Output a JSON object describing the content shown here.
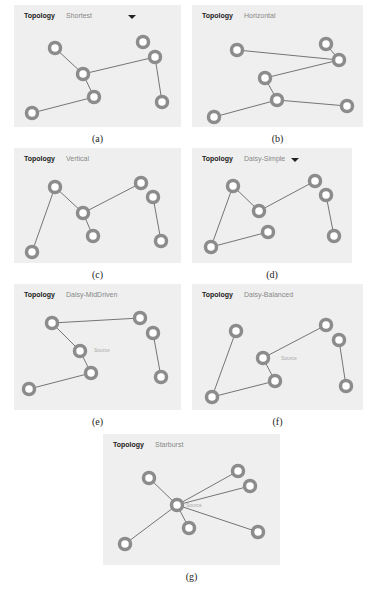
{
  "panels": [
    {
      "id": "a",
      "label": "Topology",
      "mode": "Shortest",
      "dropdown": true,
      "caption": "(a)",
      "box": [
        14,
        5,
        167,
        122
      ],
      "nodes": [
        [
          55,
          48
        ],
        [
          83,
          74
        ],
        [
          94,
          97
        ],
        [
          32,
          113
        ],
        [
          143,
          42
        ],
        [
          155,
          57
        ],
        [
          162,
          102
        ]
      ],
      "edges": [
        [
          0,
          1
        ],
        [
          1,
          2
        ],
        [
          2,
          3
        ],
        [
          1,
          5
        ],
        [
          5,
          6
        ]
      ],
      "source": null
    },
    {
      "id": "b",
      "label": "Topology",
      "mode": "Horizontal",
      "dropdown": false,
      "caption": "(b)",
      "box": [
        192,
        5,
        171,
        122
      ],
      "nodes": [
        [
          237,
          50
        ],
        [
          326,
          44
        ],
        [
          339,
          60
        ],
        [
          265,
          78
        ],
        [
          277,
          100
        ],
        [
          347,
          106
        ],
        [
          214,
          117
        ]
      ],
      "edges": [
        [
          0,
          2
        ],
        [
          1,
          2
        ],
        [
          2,
          3
        ],
        [
          3,
          4
        ],
        [
          4,
          6
        ],
        [
          4,
          5
        ]
      ],
      "source": null
    },
    {
      "id": "c",
      "label": "Topology",
      "mode": "Vertical",
      "dropdown": false,
      "caption": "(c)",
      "box": [
        14,
        148,
        167,
        115
      ],
      "nodes": [
        [
          55,
          187
        ],
        [
          83,
          213
        ],
        [
          93,
          236
        ],
        [
          32,
          252
        ],
        [
          141,
          183
        ],
        [
          153,
          197
        ],
        [
          161,
          241
        ]
      ],
      "edges": [
        [
          3,
          0
        ],
        [
          0,
          1
        ],
        [
          1,
          4
        ],
        [
          1,
          2
        ],
        [
          5,
          6
        ]
      ],
      "source": null
    },
    {
      "id": "d",
      "label": "Topology",
      "mode": "Daisy-Simple",
      "dropdown": true,
      "caption": "(d)",
      "box": [
        192,
        148,
        160,
        115
      ],
      "nodes": [
        [
          233,
          186
        ],
        [
          259,
          211
        ],
        [
          268,
          232
        ],
        [
          211,
          247
        ],
        [
          315,
          181
        ],
        [
          326,
          195
        ],
        [
          334,
          236
        ]
      ],
      "edges": [
        [
          3,
          0
        ],
        [
          0,
          1
        ],
        [
          1,
          4
        ],
        [
          3,
          2
        ],
        [
          5,
          6
        ]
      ],
      "source": null
    },
    {
      "id": "e",
      "label": "Topology",
      "mode": "Daisy-MidDriven",
      "dropdown": false,
      "caption": "(e)",
      "box": [
        14,
        284,
        167,
        126
      ],
      "nodes": [
        [
          52,
          323
        ],
        [
          80,
          351
        ],
        [
          91,
          373
        ],
        [
          29,
          389
        ],
        [
          140,
          318
        ],
        [
          153,
          333
        ],
        [
          161,
          377
        ]
      ],
      "edges": [
        [
          0,
          4
        ],
        [
          0,
          1
        ],
        [
          1,
          2
        ],
        [
          2,
          3
        ],
        [
          5,
          6
        ]
      ],
      "source": {
        "text": "Source",
        "x": 94,
        "y": 352
      }
    },
    {
      "id": "f",
      "label": "Topology",
      "mode": "Daisy-Balanced",
      "dropdown": false,
      "caption": "(f)",
      "box": [
        192,
        284,
        171,
        126
      ],
      "nodes": [
        [
          236,
          331
        ],
        [
          263,
          358
        ],
        [
          275,
          381
        ],
        [
          212,
          397
        ],
        [
          326,
          325
        ],
        [
          339,
          340
        ],
        [
          346,
          386
        ]
      ],
      "edges": [
        [
          0,
          3
        ],
        [
          3,
          2
        ],
        [
          2,
          1
        ],
        [
          1,
          4
        ],
        [
          5,
          6
        ]
      ],
      "source": {
        "text": "Source",
        "x": 281,
        "y": 360
      }
    },
    {
      "id": "g",
      "label": "Topology",
      "mode": "Starburst",
      "dropdown": false,
      "caption": "(g)",
      "box": [
        103,
        434,
        177,
        131
      ],
      "nodes": [
        [
          149,
          478
        ],
        [
          177,
          505
        ],
        [
          189,
          528
        ],
        [
          125,
          544
        ],
        [
          238,
          471
        ],
        [
          250,
          486
        ],
        [
          258,
          532
        ]
      ],
      "edges": [
        [
          1,
          0
        ],
        [
          1,
          2
        ],
        [
          1,
          3
        ],
        [
          1,
          4
        ],
        [
          1,
          5
        ],
        [
          1,
          6
        ]
      ],
      "source": {
        "text": "Source",
        "x": 186,
        "y": 507
      }
    }
  ],
  "colors": {
    "panel_bg": "#efefef",
    "node_ring": "#8c8c8c",
    "node_center": "#ffffff",
    "edge": "#555555"
  }
}
